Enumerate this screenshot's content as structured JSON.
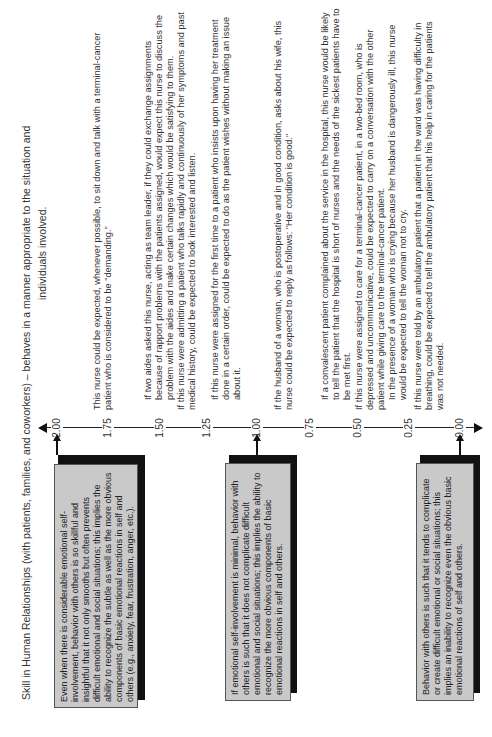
{
  "title": {
    "line1": "Skill in Human Relationships (with patients, families, and coworkers) –  behaves in a manner appropriate to the situation and",
    "line2": "individuals involved."
  },
  "scale": {
    "ticks": [
      "2.00",
      "1.75",
      "1.50",
      "1.25",
      "1.00",
      "0.75",
      "0.50",
      "0.25",
      "0.00"
    ]
  },
  "anchors": [
    {
      "value": "2.00",
      "text": "Even when there is considerable emotional self-involvement, behavior with others is so skillful and insightful that it not only smooths but often prevents difficult emotional and social situations; this implies the ability to recognize the subtle as well as the more obvious components of basic emotional reactions in self and others (e.g., anxiety, fear, frustration, anger, etc.)."
    },
    {
      "value": "1.00",
      "text": "If emotional self-involvement is minimal, behavior with others is such that it does not complicate difficult emotional and social situations; this implies the ability to recognize the more obvious components of basic emotional reactions in self and others."
    },
    {
      "value": "0.00",
      "text": "Behavior with others is such that it tends to complicate or create difficult emotional or social situations; this implies an inability to recognize even the obvious basic emotional reactions of self and others."
    }
  ],
  "statements": [
    {
      "value": "1.75",
      "items": [
        "This nurse could be expected, whenever possible, to sit down and talk with a terminal-cancer patient who is considered to be \"demanding.\""
      ]
    },
    {
      "value": "1.50",
      "items": [
        "If two aides asked this nurse, acting as team leader, if they could exchange assignments because of rapport problems with the patients assigned, would expect this nurse to discuss the problem with the aides and make certain changes which would be satisfying to them.",
        "If this nurse were admitting a patient who talks rapidly and continuously of her symptoms and past medical history, could be expected to look interested and listen."
      ]
    },
    {
      "value": "1.25",
      "items": [
        "If this nurse were assigned for the first time to a patient who insists upon having her treatment done in a certain order, could be expected to do as the patient wishes without making an issue about it."
      ]
    },
    {
      "value": "1.00",
      "items": [
        "If the husband of a woman, who is postoperative and in good condition, asks about his wife, this nurse could be expected to reply as follows: \"Her condition is good.\""
      ]
    },
    {
      "value": "0.75",
      "items": [
        "If a convalescent patient complained about the service in the hospital, this nurse would be likely to tell the patient that the hospital is short of nurses and the needs of the sickest patients have to be met first."
      ]
    },
    {
      "value": "0.50",
      "items": [
        "If this nurse were assigned to care for a terminal-cancer patient, in a two-bed room, who is depressed and uncommunicative, could be expected to carry on a conversation with the other patient while giving care to the terminal-cancer patient.",
        "In the presence of a woman who is crying because her husband is dangerously ill, this nurse would be expected to tell the woman not to cry."
      ]
    },
    {
      "value": "0.25",
      "items": [
        "If this nurse were told by an ambulatory patient that a patient in the ward was having difficulty in breathing, could be expected to tell the ambulatory patient that his help in caring for the patients was not needed."
      ]
    }
  ]
}
